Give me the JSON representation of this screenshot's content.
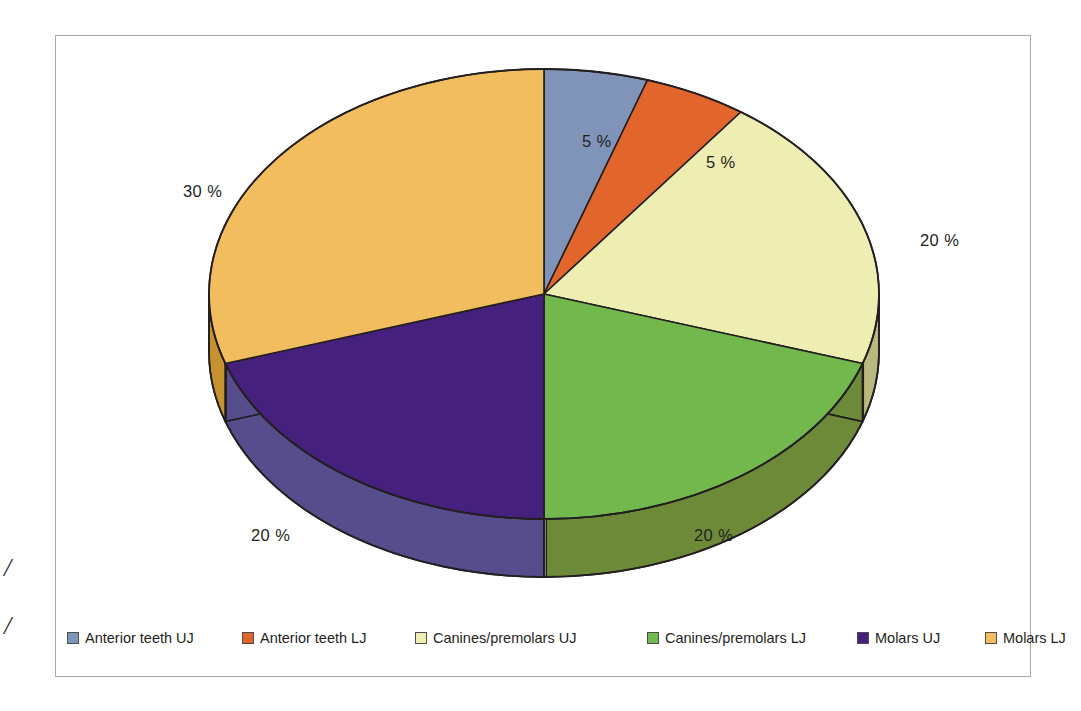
{
  "chart_data": {
    "type": "pie",
    "title": "",
    "subtitle": "",
    "xlabel": "",
    "ylabel": "",
    "legend_position": "bottom",
    "grid": false,
    "three_d": true,
    "start_angle_deg": 0,
    "direction": "clockwise",
    "categories": [
      "Anterior teeth UJ",
      "Anterior teeth LJ",
      "Canines/premolars UJ",
      "Canines/premolars LJ",
      "Molars UJ",
      "Molars LJ"
    ],
    "values": [
      5,
      5,
      20,
      20,
      20,
      30
    ],
    "value_labels": [
      "5 %",
      "5 %",
      "20 %",
      "20 %",
      "20 %",
      "30 %"
    ],
    "colors": [
      "#8093b8",
      "#e2662c",
      "#eeeeb2",
      "#72b84d",
      "#45217d",
      "#f2bd5e"
    ],
    "side_colors": [
      "#5c6c91",
      "#b14d20",
      "#b9b97f",
      "#6d8a38",
      "#574d8c",
      "#c69230"
    ],
    "units": "percent"
  },
  "pie": {
    "slices": [
      {
        "label": "Anterior teeth UJ",
        "value": 5,
        "display": "5 %",
        "color": "#8093b8",
        "side_color": "#5c6c91"
      },
      {
        "label": "Anterior teeth LJ",
        "value": 5,
        "display": "5 %",
        "color": "#e2662c",
        "side_color": "#b14d20"
      },
      {
        "label": "Canines/premolars UJ",
        "value": 20,
        "display": "20 %",
        "color": "#eeeeb2",
        "side_color": "#b9b97f"
      },
      {
        "label": "Canines/premolars LJ",
        "value": 20,
        "display": "20 %",
        "color": "#72b84d",
        "side_color": "#6d8a38"
      },
      {
        "label": "Molars UJ",
        "value": 20,
        "display": "20 %",
        "color": "#45217d",
        "side_color": "#574d8c"
      },
      {
        "label": "Molars LJ",
        "value": 30,
        "display": "30 %",
        "color": "#f2bd5e",
        "side_color": "#c69230"
      }
    ],
    "labels": {
      "anterior_uj": "5 %",
      "anterior_lj": "5 %",
      "canines_uj": "20 %",
      "canines_lj": "20 %",
      "molars_uj": "20 %",
      "molars_lj": "30 %"
    }
  },
  "legend": {
    "items": [
      {
        "label": "Anterior teeth UJ",
        "color": "#8093b8"
      },
      {
        "label": "Anterior teeth LJ",
        "color": "#e2662c"
      },
      {
        "label": "Canines/premolars UJ",
        "color": "#eeeeb2"
      },
      {
        "label": "Canines/premolars LJ",
        "color": "#72b84d"
      },
      {
        "label": "Molars UJ",
        "color": "#45217d"
      },
      {
        "label": "Molars LJ",
        "color": "#f2bd5e"
      }
    ]
  },
  "margin_marks": {
    "mark_one": "/",
    "mark_two": "/"
  },
  "colors": {
    "frame_border": "#a9a9ad",
    "outline": "#231f20",
    "text": "#231f20",
    "background": "#ffffff"
  }
}
